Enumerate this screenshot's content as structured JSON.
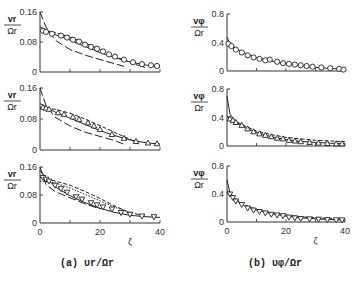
{
  "figure": {
    "captions": [
      "(a) υr/Ωr",
      "(b) υφ/Ωr"
    ],
    "xlabel": "ζ",
    "x_ticks": [
      "0",
      "20",
      "40"
    ]
  },
  "chart_data": [
    {
      "type": "scatter",
      "panel": "a1",
      "ylabel": "vr/Ωr",
      "y_ticks": [
        "0",
        "0.08",
        "0.16"
      ],
      "ylim": [
        0,
        0.16
      ],
      "xlim": [
        0,
        40
      ],
      "marker": "circle",
      "points": [
        [
          1,
          0.11
        ],
        [
          2,
          0.107
        ],
        [
          4,
          0.102
        ],
        [
          7,
          0.097
        ],
        [
          9,
          0.092
        ],
        [
          11,
          0.086
        ],
        [
          13,
          0.081
        ],
        [
          15,
          0.073
        ],
        [
          17,
          0.067
        ],
        [
          19,
          0.062
        ],
        [
          21,
          0.055
        ],
        [
          23,
          0.047
        ],
        [
          25,
          0.041
        ],
        [
          28,
          0.033
        ],
        [
          31,
          0.026
        ],
        [
          34,
          0.021
        ],
        [
          37,
          0.018
        ],
        [
          39,
          0.016
        ]
      ],
      "curves": {
        "solid": [
          [
            0,
            0.12
          ],
          [
            5,
            0.1
          ],
          [
            10,
            0.085
          ],
          [
            15,
            0.068
          ],
          [
            20,
            0.052
          ],
          [
            25,
            0.038
          ],
          [
            30,
            0.027
          ],
          [
            35,
            0.019
          ],
          [
            40,
            0.013
          ]
        ],
        "dashed": [
          [
            0,
            0.11
          ],
          [
            5,
            0.105
          ],
          [
            10,
            0.093
          ],
          [
            15,
            0.077
          ],
          [
            20,
            0.06
          ],
          [
            25,
            0.042
          ],
          [
            30,
            0.025
          ],
          [
            35,
            0.012
          ]
        ],
        "longdash": [
          [
            0,
            0.16
          ],
          [
            2,
            0.12
          ],
          [
            5,
            0.085
          ],
          [
            10,
            0.06
          ],
          [
            15,
            0.045
          ],
          [
            20,
            0.033
          ],
          [
            25,
            0.022
          ],
          [
            28,
            0.015
          ]
        ]
      }
    },
    {
      "type": "scatter",
      "panel": "a2",
      "ylabel": "vr/Ωr",
      "y_ticks": [
        "0",
        "0.08",
        "0.16"
      ],
      "ylim": [
        0,
        0.16
      ],
      "xlim": [
        0,
        40
      ],
      "marker": "triangle-up",
      "points": [
        [
          1,
          0.11
        ],
        [
          2,
          0.108
        ],
        [
          3,
          0.105
        ],
        [
          6,
          0.096
        ],
        [
          8,
          0.092
        ],
        [
          11,
          0.085
        ],
        [
          13,
          0.079
        ],
        [
          16,
          0.07
        ],
        [
          18,
          0.062
        ],
        [
          20,
          0.053
        ],
        [
          24,
          0.04
        ],
        [
          28,
          0.03
        ],
        [
          32,
          0.022
        ],
        [
          36,
          0.018
        ],
        [
          39,
          0.016
        ]
      ],
      "curves": {
        "solid": [
          [
            0,
            0.12
          ],
          [
            5,
            0.098
          ],
          [
            10,
            0.082
          ],
          [
            15,
            0.066
          ],
          [
            20,
            0.05
          ],
          [
            25,
            0.037
          ],
          [
            30,
            0.026
          ],
          [
            35,
            0.019
          ],
          [
            40,
            0.015
          ]
        ],
        "dashed": [
          [
            0,
            0.11
          ],
          [
            5,
            0.105
          ],
          [
            10,
            0.095
          ],
          [
            15,
            0.08
          ],
          [
            20,
            0.063
          ],
          [
            25,
            0.045
          ],
          [
            30,
            0.028
          ],
          [
            33,
            0.015
          ]
        ],
        "longdash": [
          [
            0,
            0.16
          ],
          [
            2,
            0.115
          ],
          [
            5,
            0.085
          ],
          [
            10,
            0.062
          ],
          [
            15,
            0.046
          ],
          [
            20,
            0.035
          ],
          [
            25,
            0.024
          ],
          [
            28,
            0.015
          ]
        ]
      }
    },
    {
      "type": "scatter",
      "panel": "a3",
      "ylabel": "vr/Ωr",
      "y_ticks": [
        "0",
        "0.08",
        "0.16"
      ],
      "ylim": [
        0,
        0.16
      ],
      "xlim": [
        0,
        40
      ],
      "marker": "triangle-down",
      "points": [
        [
          1,
          0.13
        ],
        [
          2,
          0.125
        ],
        [
          3,
          0.12
        ],
        [
          5,
          0.108
        ],
        [
          7,
          0.098
        ],
        [
          9,
          0.088
        ],
        [
          12,
          0.075
        ],
        [
          14,
          0.068
        ],
        [
          17,
          0.058
        ],
        [
          19,
          0.052
        ],
        [
          21,
          0.046
        ],
        [
          24,
          0.04
        ],
        [
          27,
          0.03
        ],
        [
          30,
          0.025
        ],
        [
          34,
          0.02
        ],
        [
          38,
          0.018
        ]
      ],
      "curves": {
        "solid": [
          [
            0,
            0.15
          ],
          [
            3,
            0.12
          ],
          [
            6,
            0.098
          ],
          [
            10,
            0.078
          ],
          [
            15,
            0.058
          ],
          [
            20,
            0.042
          ],
          [
            25,
            0.03
          ],
          [
            30,
            0.022
          ],
          [
            35,
            0.018
          ],
          [
            40,
            0.016
          ]
        ],
        "dashed": [
          [
            0,
            0.13
          ],
          [
            5,
            0.12
          ],
          [
            10,
            0.108
          ],
          [
            15,
            0.09
          ],
          [
            20,
            0.07
          ],
          [
            25,
            0.048
          ],
          [
            30,
            0.03
          ],
          [
            35,
            0.02
          ]
        ],
        "dotted": [
          [
            0,
            0.12
          ],
          [
            5,
            0.115
          ],
          [
            10,
            0.1
          ],
          [
            15,
            0.082
          ],
          [
            20,
            0.063
          ],
          [
            25,
            0.045
          ],
          [
            30,
            0.03
          ]
        ],
        "longdash": [
          [
            0,
            0.16
          ],
          [
            2,
            0.11
          ],
          [
            5,
            0.09
          ],
          [
            10,
            0.072
          ],
          [
            15,
            0.055
          ],
          [
            20,
            0.04
          ]
        ]
      }
    },
    {
      "type": "scatter",
      "panel": "b1",
      "ylabel": "vφ/Ωr",
      "y_ticks": [
        "0",
        "0.4",
        "0.8"
      ],
      "ylim": [
        0,
        0.8
      ],
      "xlim": [
        0,
        40
      ],
      "marker": "circle",
      "points": [
        [
          0.5,
          0.38
        ],
        [
          1.5,
          0.35
        ],
        [
          3,
          0.3
        ],
        [
          5,
          0.26
        ],
        [
          7,
          0.22
        ],
        [
          9,
          0.19
        ],
        [
          11,
          0.17
        ],
        [
          13,
          0.15
        ],
        [
          14.5,
          0.16
        ],
        [
          17,
          0.13
        ],
        [
          19,
          0.11
        ],
        [
          21,
          0.1
        ],
        [
          23,
          0.09
        ],
        [
          25,
          0.08
        ],
        [
          27,
          0.07
        ],
        [
          29,
          0.06
        ],
        [
          32,
          0.05
        ],
        [
          35,
          0.04
        ],
        [
          38,
          0.03
        ],
        [
          39.5,
          0.02
        ]
      ],
      "curves": {
        "solid": [
          [
            0,
            0.48
          ],
          [
            1,
            0.38
          ],
          [
            3,
            0.32
          ],
          [
            6,
            0.25
          ],
          [
            10,
            0.19
          ],
          [
            15,
            0.14
          ],
          [
            20,
            0.1
          ],
          [
            25,
            0.07
          ],
          [
            30,
            0.05
          ],
          [
            35,
            0.035
          ],
          [
            40,
            0.025
          ]
        ]
      }
    },
    {
      "type": "scatter",
      "panel": "b2",
      "ylabel": "vφ/Ωr",
      "y_ticks": [
        "0",
        "0.4",
        "0.8"
      ],
      "ylim": [
        0,
        0.8
      ],
      "xlim": [
        0,
        40
      ],
      "marker": "triangle-up",
      "points": [
        [
          1,
          0.38
        ],
        [
          2,
          0.36
        ],
        [
          3,
          0.33
        ],
        [
          5,
          0.29
        ],
        [
          7,
          0.24
        ],
        [
          9,
          0.2
        ],
        [
          11,
          0.17
        ],
        [
          13,
          0.15
        ],
        [
          15,
          0.13
        ],
        [
          17,
          0.11
        ],
        [
          19,
          0.1
        ],
        [
          21,
          0.08
        ],
        [
          23,
          0.07
        ],
        [
          25,
          0.06
        ],
        [
          28,
          0.05
        ],
        [
          31,
          0.04
        ],
        [
          34,
          0.035
        ],
        [
          37,
          0.03
        ],
        [
          39,
          0.03
        ]
      ],
      "curves": {
        "solid": [
          [
            0,
            0.7
          ],
          [
            1,
            0.45
          ],
          [
            3,
            0.34
          ],
          [
            6,
            0.26
          ],
          [
            10,
            0.19
          ],
          [
            15,
            0.13
          ],
          [
            20,
            0.09
          ],
          [
            25,
            0.065
          ],
          [
            30,
            0.05
          ],
          [
            35,
            0.04
          ],
          [
            40,
            0.03
          ]
        ],
        "dashed": [
          [
            0,
            0.42
          ],
          [
            5,
            0.3
          ],
          [
            10,
            0.21
          ],
          [
            15,
            0.16
          ],
          [
            20,
            0.12
          ],
          [
            25,
            0.1
          ],
          [
            30,
            0.08
          ],
          [
            35,
            0.07
          ],
          [
            40,
            0.06
          ]
        ]
      }
    },
    {
      "type": "scatter",
      "panel": "b3",
      "ylabel": "vφ/Ωr",
      "y_ticks": [
        "0",
        "0.4",
        "0.8"
      ],
      "ylim": [
        0,
        0.8
      ],
      "xlim": [
        0,
        40
      ],
      "marker": "triangle-down",
      "points": [
        [
          1,
          0.4
        ],
        [
          2,
          0.35
        ],
        [
          3,
          0.3
        ],
        [
          5,
          0.25
        ],
        [
          7,
          0.2
        ],
        [
          9,
          0.17
        ],
        [
          11,
          0.15
        ],
        [
          13,
          0.13
        ],
        [
          15,
          0.11
        ],
        [
          17,
          0.1
        ],
        [
          19,
          0.09
        ],
        [
          21,
          0.07
        ],
        [
          23,
          0.06
        ],
        [
          25,
          0.05
        ],
        [
          28,
          0.045
        ],
        [
          31,
          0.04
        ],
        [
          34,
          0.035
        ],
        [
          37,
          0.03
        ],
        [
          39,
          0.03
        ]
      ],
      "curves": {
        "solid": [
          [
            0,
            0.6
          ],
          [
            1,
            0.42
          ],
          [
            3,
            0.32
          ],
          [
            6,
            0.23
          ],
          [
            10,
            0.17
          ],
          [
            15,
            0.12
          ],
          [
            20,
            0.085
          ],
          [
            25,
            0.06
          ],
          [
            30,
            0.045
          ],
          [
            35,
            0.035
          ],
          [
            40,
            0.03
          ]
        ],
        "dashed": [
          [
            0,
            0.45
          ],
          [
            5,
            0.26
          ],
          [
            10,
            0.18
          ],
          [
            15,
            0.13
          ],
          [
            20,
            0.1
          ],
          [
            25,
            0.075
          ],
          [
            30,
            0.06
          ],
          [
            35,
            0.05
          ],
          [
            40,
            0.045
          ]
        ]
      }
    }
  ],
  "layout": {
    "panels": [
      {
        "x0": 40,
        "x1": 160,
        "ytop": 12,
        "ybot": 72
      },
      {
        "x0": 40,
        "x1": 160,
        "ytop": 88,
        "ybot": 150
      },
      {
        "x0": 40,
        "x1": 160,
        "ytop": 167,
        "ybot": 223
      },
      {
        "x0": 227,
        "x1": 345,
        "ytop": 14,
        "ybot": 71
      },
      {
        "x0": 227,
        "x1": 345,
        "ytop": 89,
        "ybot": 146
      },
      {
        "x0": 227,
        "x1": 345,
        "ytop": 166,
        "ybot": 222
      }
    ]
  }
}
